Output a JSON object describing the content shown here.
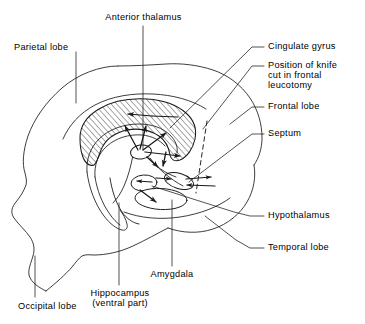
{
  "figure": {
    "stroke_color": "#1a1a1a",
    "background_color": "#ffffff",
    "hatch_region_name": "cingulate gyrus"
  },
  "labels": {
    "anterior_thalamus": "Anterior thalamus",
    "parietal_lobe": "Parietal lobe",
    "cingulate_gyrus": "Cingulate gyrus",
    "knife_cut_line1": "Position of knife",
    "knife_cut_line2": "cut in frontal",
    "knife_cut_line3": "leucotomy",
    "frontal_lobe": "Frontal lobe",
    "septum": "Septum",
    "hypothalamus": "Hypothalamus",
    "temporal_lobe": "Temporal lobe",
    "amygdala": "Amygdala",
    "hippocampus_line1": "Hippocampus",
    "hippocampus_line2": "(ventral part)",
    "occipital_lobe": "Occipital lobe"
  },
  "structures": [
    {
      "name": "cingulate-gyrus",
      "label": "Cingulate gyrus",
      "rendering": "hatched-band"
    },
    {
      "name": "anterior-thalamus",
      "label": "Anterior thalamus",
      "rendering": "small-oval"
    },
    {
      "name": "septum",
      "label": "Septum",
      "rendering": "oval"
    },
    {
      "name": "hypothalamus",
      "label": "Hypothalamus",
      "rendering": "oval"
    },
    {
      "name": "amygdala",
      "label": "Amygdala",
      "rendering": "oval"
    },
    {
      "name": "hippocampus",
      "label": "Hippocampus (ventral part)",
      "rendering": "curved-band"
    },
    {
      "name": "frontal-lobe",
      "label": "Frontal lobe",
      "rendering": "outline"
    },
    {
      "name": "parietal-lobe",
      "label": "Parietal lobe",
      "rendering": "outline"
    },
    {
      "name": "occipital-lobe",
      "label": "Occipital lobe",
      "rendering": "outline"
    },
    {
      "name": "temporal-lobe",
      "label": "Temporal lobe",
      "rendering": "outline"
    },
    {
      "name": "knife-cut",
      "label": "Position of knife cut in frontal leucotomy",
      "rendering": "dashed-line"
    }
  ]
}
